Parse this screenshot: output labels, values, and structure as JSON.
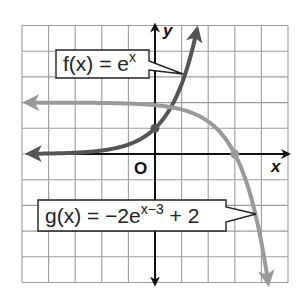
{
  "chart_data": {
    "type": "line",
    "title": "",
    "xlabel": "x",
    "ylabel": "y",
    "origin_label": "O",
    "xlim": [
      -5,
      5
    ],
    "ylim": [
      -5,
      5
    ],
    "grid": true,
    "grid_step": 1,
    "series": [
      {
        "name": "f(x) = e^x",
        "label_main": "f(x) = e",
        "label_sup": "x",
        "color": "#555555",
        "formula": "e^x",
        "x": [
          -5,
          -4,
          -3,
          -2,
          -1,
          0,
          1,
          1.6
        ],
        "y": [
          0.01,
          0.02,
          0.05,
          0.14,
          0.37,
          1,
          2.72,
          4.95
        ],
        "marked_point": [
          0,
          1
        ]
      },
      {
        "name": "g(x) = -2e^(x-3) + 2",
        "label_main": "g(x) = −2e",
        "label_sup": "x−3",
        "label_tail": " + 2",
        "color": "#9a9a9a",
        "formula": "-2e^(x-3)+2",
        "x": [
          -5,
          -3,
          -1,
          0,
          1,
          2,
          3,
          3.5,
          4,
          4.3
        ],
        "y": [
          2.0,
          2.0,
          1.96,
          1.9,
          1.73,
          1.26,
          0,
          -1.3,
          -3.44,
          -5.0
        ],
        "marked_point": [
          3,
          0
        ],
        "asymptote_y": 2
      }
    ]
  }
}
